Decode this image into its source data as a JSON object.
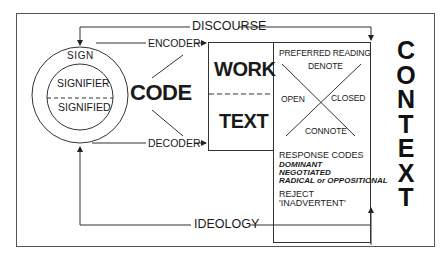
{
  "diagram": {
    "sign": {
      "outer_label": "SIGN",
      "upper": "SIGNIFIER",
      "lower": "SIGNIFIED"
    },
    "code_label": "CODE",
    "encoder_label": "ENCODER",
    "decoder_label": "DECODER",
    "discourse_label": "DISCOURSE",
    "ideology_label": "IDEOLOGY",
    "work_box": {
      "upper": "WORK",
      "lower": "TEXT"
    },
    "reading_box": {
      "title": "PREFERRED READING",
      "top": "DENOTE",
      "left": "OPEN",
      "right": "CLOSED",
      "bottom": "CONNOTE",
      "response_title": "RESPONSE CODES",
      "responses": [
        "DOMINANT",
        "NEGOTIATED",
        "RADICAL or OPPOSITIONAL"
      ],
      "reject_title": "REJECT",
      "reject_item": "'INADVERTENT'"
    },
    "context_letters": [
      "C",
      "O",
      "N",
      "T",
      "E",
      "X",
      "T"
    ],
    "colors": {
      "line": "#3a3a3a",
      "text": "#1a1a1a",
      "background": "#ffffff"
    }
  }
}
